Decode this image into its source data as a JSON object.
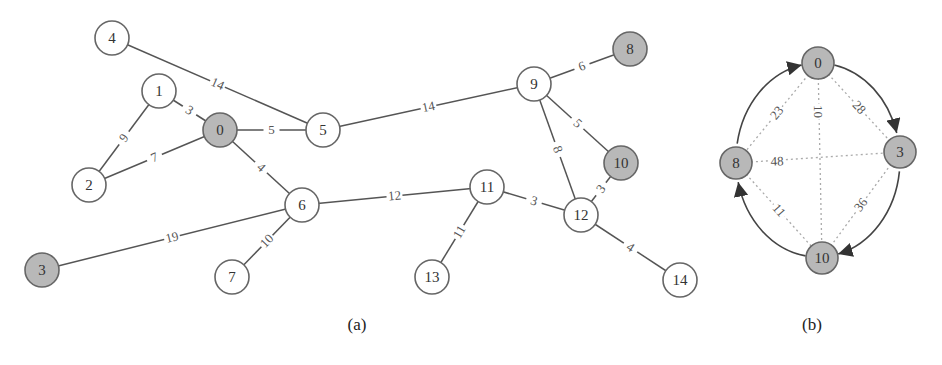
{
  "figure_a": {
    "caption": "(a)",
    "caption_pos": [
      357,
      330
    ],
    "node_radius": 17,
    "nodes": [
      {
        "id": "0",
        "x": 220,
        "y": 130,
        "highlighted": true
      },
      {
        "id": "1",
        "x": 159,
        "y": 91,
        "highlighted": false
      },
      {
        "id": "2",
        "x": 89,
        "y": 185,
        "highlighted": false
      },
      {
        "id": "3",
        "x": 42,
        "y": 270,
        "highlighted": true
      },
      {
        "id": "4",
        "x": 112,
        "y": 38,
        "highlighted": false
      },
      {
        "id": "5",
        "x": 323,
        "y": 130,
        "highlighted": false
      },
      {
        "id": "6",
        "x": 302,
        "y": 205,
        "highlighted": false
      },
      {
        "id": "7",
        "x": 232,
        "y": 277,
        "highlighted": false
      },
      {
        "id": "8",
        "x": 630,
        "y": 49,
        "highlighted": true
      },
      {
        "id": "9",
        "x": 534,
        "y": 84,
        "highlighted": false
      },
      {
        "id": "10",
        "x": 621,
        "y": 163,
        "highlighted": true
      },
      {
        "id": "11",
        "x": 487,
        "y": 187,
        "highlighted": false
      },
      {
        "id": "12",
        "x": 581,
        "y": 215,
        "highlighted": false
      },
      {
        "id": "13",
        "x": 432,
        "y": 277,
        "highlighted": false
      },
      {
        "id": "14",
        "x": 680,
        "y": 280,
        "highlighted": false
      }
    ],
    "edges": [
      {
        "from": "4",
        "to": "5",
        "weight": "14"
      },
      {
        "from": "1",
        "to": "0",
        "weight": "3"
      },
      {
        "from": "1",
        "to": "2",
        "weight": "9"
      },
      {
        "from": "2",
        "to": "0",
        "weight": "7"
      },
      {
        "from": "0",
        "to": "5",
        "weight": "5"
      },
      {
        "from": "0",
        "to": "6",
        "weight": "4"
      },
      {
        "from": "5",
        "to": "9",
        "weight": "14"
      },
      {
        "from": "9",
        "to": "8",
        "weight": "6"
      },
      {
        "from": "9",
        "to": "10",
        "weight": "5"
      },
      {
        "from": "9",
        "to": "12",
        "weight": "8"
      },
      {
        "from": "10",
        "to": "12",
        "weight": "3"
      },
      {
        "from": "6",
        "to": "11",
        "weight": "12"
      },
      {
        "from": "6",
        "to": "3",
        "weight": "19"
      },
      {
        "from": "6",
        "to": "7",
        "weight": "10"
      },
      {
        "from": "11",
        "to": "12",
        "weight": "3"
      },
      {
        "from": "11",
        "to": "13",
        "weight": "11"
      },
      {
        "from": "12",
        "to": "14",
        "weight": "4"
      }
    ]
  },
  "figure_b": {
    "caption": "(b)",
    "caption_pos": [
      812,
      330
    ],
    "node_radius": 16,
    "nodes": [
      {
        "id": "0",
        "x": 818,
        "y": 63,
        "highlighted": true
      },
      {
        "id": "3",
        "x": 900,
        "y": 152,
        "highlighted": true
      },
      {
        "id": "10",
        "x": 822,
        "y": 258,
        "highlighted": true
      },
      {
        "id": "8",
        "x": 736,
        "y": 163,
        "highlighted": true
      }
    ],
    "cycle_edges": [
      {
        "from": "8",
        "to": "0"
      },
      {
        "from": "0",
        "to": "3"
      },
      {
        "from": "3",
        "to": "10"
      },
      {
        "from": "10",
        "to": "8"
      }
    ],
    "dotted_edges": [
      {
        "from": "0",
        "to": "8",
        "weight": "23"
      },
      {
        "from": "0",
        "to": "3",
        "weight": "28"
      },
      {
        "from": "0",
        "to": "10",
        "weight": "10"
      },
      {
        "from": "8",
        "to": "3",
        "weight": "48"
      },
      {
        "from": "8",
        "to": "10",
        "weight": "11"
      },
      {
        "from": "3",
        "to": "10",
        "weight": "36"
      }
    ]
  },
  "colors": {
    "edge": "#555555",
    "dotted_edge": "#aaaaaa",
    "node_stroke": "#666666",
    "node_fill": "#ffffff",
    "node_highlight_fill": "#b8b8b8"
  }
}
